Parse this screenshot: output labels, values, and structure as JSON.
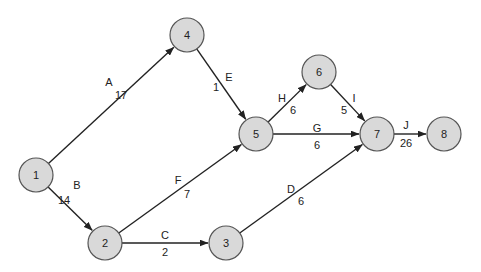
{
  "diagram": {
    "type": "activity-on-arrow network",
    "node_radius": 17,
    "colors": {
      "node_fill": "#d9d9d9",
      "node_stroke": "#555555",
      "edge": "#222222"
    },
    "nodes": [
      {
        "id": "1",
        "x": 36,
        "y": 175
      },
      {
        "id": "2",
        "x": 105,
        "y": 243
      },
      {
        "id": "3",
        "x": 226,
        "y": 243
      },
      {
        "id": "4",
        "x": 187,
        "y": 35
      },
      {
        "id": "5",
        "x": 256,
        "y": 134
      },
      {
        "id": "6",
        "x": 319,
        "y": 72
      },
      {
        "id": "7",
        "x": 377,
        "y": 134
      },
      {
        "id": "8",
        "x": 444,
        "y": 134
      }
    ],
    "edges": [
      {
        "activity": "A",
        "duration": "17",
        "from": "1",
        "to": "4",
        "lx": 109,
        "ly": 82,
        "dx": 121,
        "dy": 95
      },
      {
        "activity": "B",
        "duration": "14",
        "from": "1",
        "to": "2",
        "lx": 77,
        "ly": 185,
        "dx": 64,
        "dy": 200
      },
      {
        "activity": "C",
        "duration": "2",
        "from": "2",
        "to": "3",
        "lx": 165,
        "ly": 235,
        "dx": 165,
        "dy": 252
      },
      {
        "activity": "D",
        "duration": "6",
        "from": "3",
        "to": "7",
        "lx": 291,
        "ly": 189,
        "dx": 301,
        "dy": 201
      },
      {
        "activity": "E",
        "duration": "1",
        "from": "4",
        "to": "5",
        "lx": 229,
        "ly": 77,
        "dx": 216,
        "dy": 87
      },
      {
        "activity": "F",
        "duration": "7",
        "from": "2",
        "to": "5",
        "lx": 178,
        "ly": 180,
        "dx": 187,
        "dy": 194
      },
      {
        "activity": "G",
        "duration": "6",
        "from": "5",
        "to": "7",
        "lx": 317,
        "ly": 128,
        "dx": 317,
        "dy": 145
      },
      {
        "activity": "H",
        "duration": "6",
        "from": "5",
        "to": "6",
        "lx": 282,
        "ly": 98,
        "dx": 293,
        "dy": 110
      },
      {
        "activity": "I",
        "duration": "5",
        "from": "6",
        "to": "7",
        "lx": 354,
        "ly": 98,
        "dx": 344,
        "dy": 110
      },
      {
        "activity": "J",
        "duration": "26",
        "from": "7",
        "to": "8",
        "lx": 406,
        "ly": 125,
        "dx": 406,
        "dy": 143
      }
    ]
  }
}
